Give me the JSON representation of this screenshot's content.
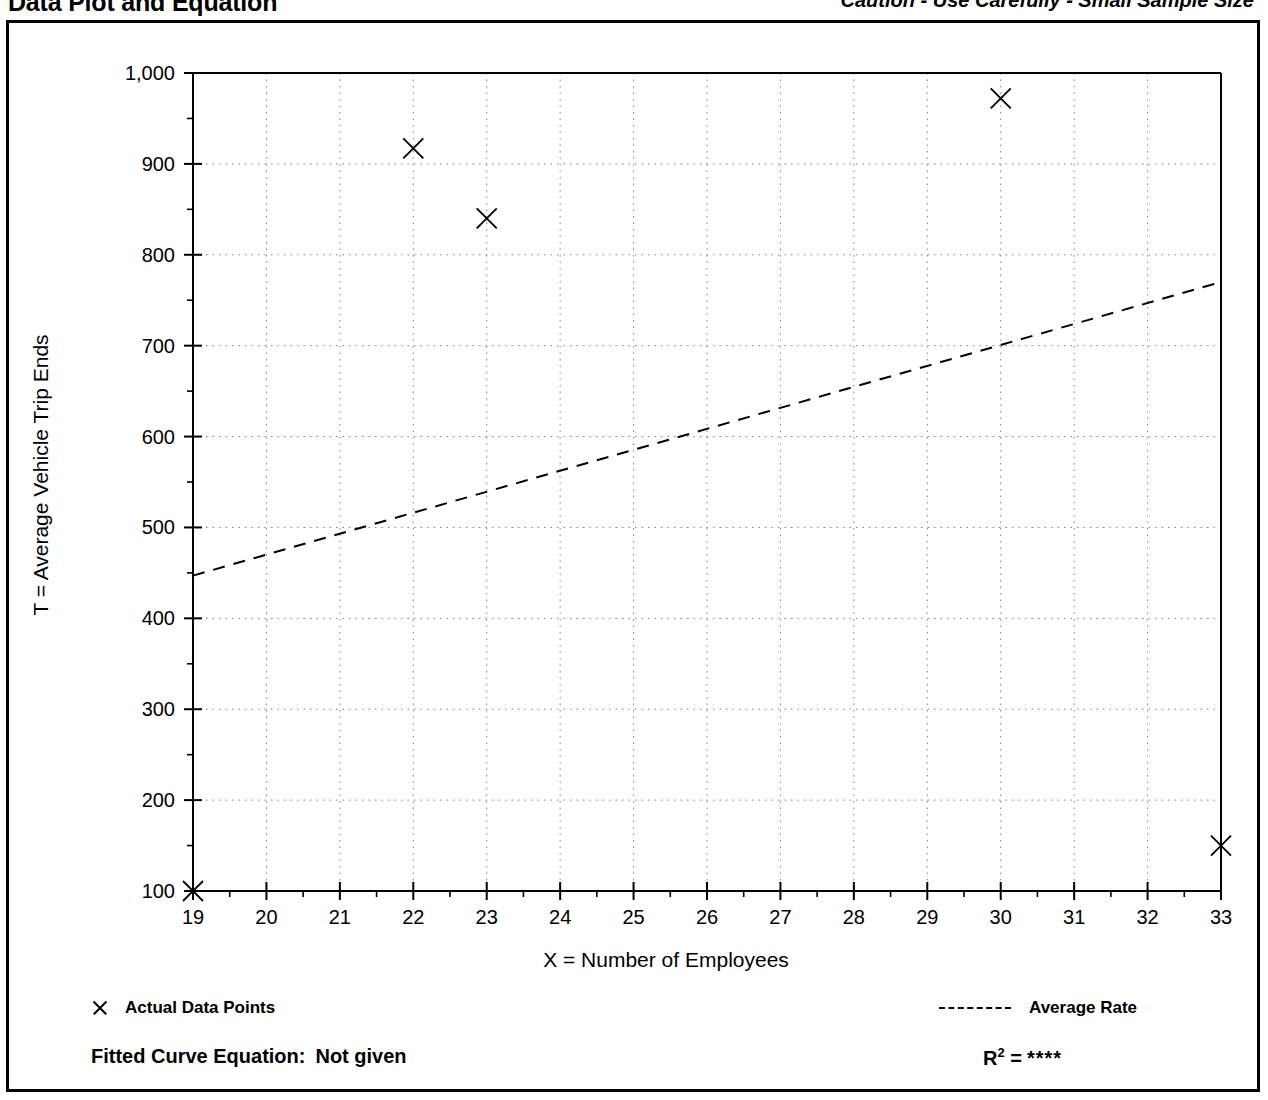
{
  "header": {
    "title": "Data Plot and Equation",
    "caution": "Caution - Use Carefully - Small Sample Size"
  },
  "legend": {
    "data_points_label": "Actual Data Points",
    "data_points_marker": "x-marker-icon",
    "average_rate_label": "Average Rate",
    "average_rate_marker": "dashed-line-icon"
  },
  "footer": {
    "equation_label": "Fitted Curve Equation:",
    "equation_value": "Not given",
    "r_squared_label": "R",
    "r_squared_exponent": "2",
    "r_squared_equals": "=",
    "r_squared_value": "****"
  },
  "chart_data": {
    "type": "scatter",
    "title": "Data Plot and Equation",
    "xlabel": "X = Number of Employees",
    "ylabel": "T = Average Vehicle Trip Ends",
    "xlim": [
      19,
      33
    ],
    "ylim": [
      100,
      1000
    ],
    "xticks": [
      19,
      20,
      21,
      22,
      23,
      24,
      25,
      26,
      27,
      28,
      29,
      30,
      31,
      32,
      33
    ],
    "xtick_labels": [
      "19",
      "20",
      "21",
      "22",
      "23",
      "24",
      "25",
      "26",
      "27",
      "28",
      "29",
      "30",
      "31",
      "32",
      "33"
    ],
    "yticks": [
      100,
      200,
      300,
      400,
      500,
      600,
      700,
      800,
      900,
      1000
    ],
    "ytick_labels": [
      "100",
      "200",
      "300",
      "400",
      "500",
      "600",
      "700",
      "800",
      "900",
      "1,000"
    ],
    "y_minor_ticks": [
      150,
      250,
      350,
      450,
      550,
      650,
      750,
      850,
      950
    ],
    "grid": true,
    "grid_style": "dotted",
    "legend_position": "below-plot",
    "series": [
      {
        "name": "Actual Data Points",
        "marker": "x",
        "points": [
          {
            "x": 19,
            "y": 100
          },
          {
            "x": 22,
            "y": 917
          },
          {
            "x": 23,
            "y": 840
          },
          {
            "x": 30,
            "y": 972
          },
          {
            "x": 33,
            "y": 150
          }
        ]
      },
      {
        "name": "Average Rate",
        "style": "dashed",
        "points": [
          {
            "x": 19,
            "y": 447
          },
          {
            "x": 33,
            "y": 770
          }
        ]
      }
    ]
  },
  "colors": {
    "line": "#000000",
    "grid": "#808080",
    "background": "#ffffff"
  }
}
